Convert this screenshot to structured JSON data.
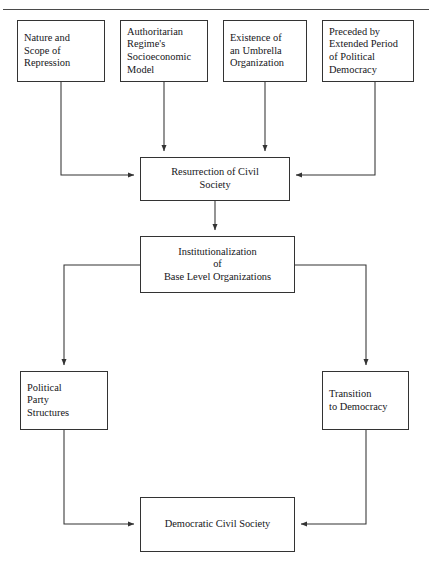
{
  "page": {
    "title_fragment": "",
    "background_color": "#ffffff",
    "line_color": "#333333",
    "rule_color": "#4a4a4a",
    "text_color": "#16161a"
  },
  "diagram": {
    "type": "flowchart",
    "orientation": "top-to-bottom",
    "nodes": [
      {
        "id": "nature-scope-repression",
        "label": "Nature and\nScope of\nRepression",
        "x": 17,
        "y": 20,
        "w": 88,
        "h": 62,
        "align": "left"
      },
      {
        "id": "authoritarian-regime-model",
        "label": "Authoritarian\nRegime's\nSocioeconomic\nModel",
        "x": 120,
        "y": 20,
        "w": 88,
        "h": 62,
        "align": "left"
      },
      {
        "id": "umbrella-organization",
        "label": "Existence of\nan Umbrella\nOrganization",
        "x": 223,
        "y": 20,
        "w": 84,
        "h": 62,
        "align": "left"
      },
      {
        "id": "preceded-political-democracy",
        "label": "Preceded by\nExtended Period\nof Political\nDemocracy",
        "x": 322,
        "y": 20,
        "w": 92,
        "h": 62,
        "align": "left"
      },
      {
        "id": "resurrection-civil-society",
        "label": "Resurrection of Civil\nSociety",
        "x": 140,
        "y": 157,
        "w": 150,
        "h": 44,
        "align": "center"
      },
      {
        "id": "institutionalization-base-level",
        "label": "Institutionalization\nof\nBase Level Organizations",
        "x": 140,
        "y": 236,
        "w": 155,
        "h": 57,
        "align": "center"
      },
      {
        "id": "political-party-structures",
        "label": "Political\nParty\nStructures",
        "x": 20,
        "y": 371,
        "w": 88,
        "h": 59,
        "align": "left"
      },
      {
        "id": "transition-to-democracy",
        "label": "Transition\nto Democracy",
        "x": 322,
        "y": 371,
        "w": 87,
        "h": 59,
        "align": "left"
      },
      {
        "id": "democratic-civil-society",
        "label": "Democratic Civil Society",
        "x": 140,
        "y": 497,
        "w": 155,
        "h": 55,
        "align": "center"
      }
    ],
    "edges": [
      {
        "id": "edge-nature-to-resurrection",
        "from": "nature-scope-repression",
        "to": "resurrection-civil-society",
        "arrow": true
      },
      {
        "id": "edge-regime-to-resurrection",
        "from": "authoritarian-regime-model",
        "to": "resurrection-civil-society",
        "arrow": true
      },
      {
        "id": "edge-umbrella-to-resurrection",
        "from": "umbrella-organization",
        "to": "resurrection-civil-society",
        "arrow": true
      },
      {
        "id": "edge-preceded-to-resurrection",
        "from": "preceded-political-democracy",
        "to": "resurrection-civil-society",
        "arrow": true
      },
      {
        "id": "edge-resurrection-to-institutionalization",
        "from": "resurrection-civil-society",
        "to": "institutionalization-base-level",
        "arrow": true
      },
      {
        "id": "edge-institutionalization-to-party",
        "from": "institutionalization-base-level",
        "to": "political-party-structures",
        "arrow": true
      },
      {
        "id": "edge-institutionalization-to-transition",
        "from": "institutionalization-base-level",
        "to": "transition-to-democracy",
        "arrow": true
      },
      {
        "id": "edge-party-to-democratic",
        "from": "political-party-structures",
        "to": "democratic-civil-society",
        "arrow": true
      },
      {
        "id": "edge-transition-to-democratic",
        "from": "transition-to-democracy",
        "to": "democratic-civil-society",
        "arrow": true
      }
    ]
  }
}
